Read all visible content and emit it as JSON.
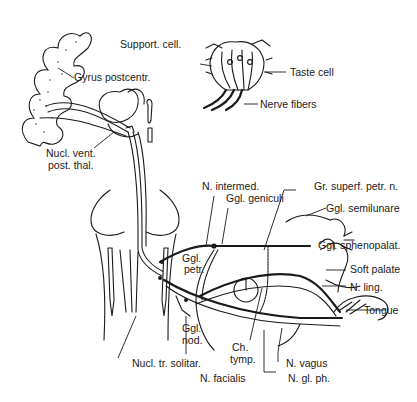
{
  "diagram": {
    "colors": {
      "ink": "#1a1a1a",
      "background": "#ffffff"
    },
    "inset": {
      "title": "Taste bud",
      "labels": {
        "support_cell": "Support. cell.",
        "taste_cell": "Taste cell",
        "nerve_fibers": "Nerve fibers"
      }
    },
    "labels": {
      "gyrus_postcentr": "Gyrus postcentr.",
      "nucl_vent_post_thal_1": "Nucl. vent.",
      "nucl_vent_post_thal_2": "post. thal.",
      "n_intermed": "N. intermed.",
      "ggl_geniculi": "Ggl. geniculi",
      "gr_superf_petr_n": "Gr. superf. petr. n.",
      "ggl_semilunare": "Ggl. semilunare",
      "ggl_sphenopalat": "Ggl. sphenopalat.",
      "soft_palate": "Soft palate",
      "n_ling": "N. ling.",
      "tongue": "Tongue",
      "ggl_petr_1": "Ggl.",
      "ggl_petr_2": "petr.",
      "ggl_nod_1": "Ggl.",
      "ggl_nod_2": "nod.",
      "ch_tymp_1": "Ch.",
      "ch_tymp_2": "tymp.",
      "nucl_tr_solitar": "Nucl. tr. solitar.",
      "n_facialis": "N. facialis",
      "n_vagus": "N. vagus",
      "n_gl_ph": "N. gl. ph."
    }
  }
}
